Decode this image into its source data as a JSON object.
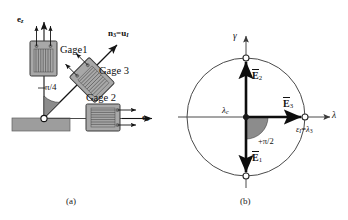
{
  "figure": {
    "panel_a": {
      "caption": "(a)",
      "axis_vertical_label": "e",
      "axis_vertical_sub": "z",
      "axis_horizontal_label": "e",
      "axis_horizontal_sub": "θ",
      "gage1_label": "Gage1",
      "gage2_label": "Gage 2",
      "gage3_label": "Gage 3",
      "normal_label_n": "n",
      "normal_label_n_sub": "3",
      "normal_label_eq": "=",
      "normal_label_u": "u",
      "normal_label_u_sub": "I",
      "angle_label": "π/4",
      "colors": {
        "gage_fill": "#a8a8a8",
        "gage_stroke": "#3a3a3a",
        "plate_fill": "#9d9d9d",
        "wedge_fill": "#8c8c8c",
        "line": "#141414"
      }
    },
    "panel_b": {
      "caption": "(b)",
      "axis_y_label": "γ",
      "axis_x_label": "λ",
      "center_label": "λ",
      "center_label_sub": "c",
      "vec_e1": "E",
      "vec_e1_sub": "1",
      "vec_e2": "E",
      "vec_e2_sub": "2",
      "vec_e3": "E",
      "vec_e3_sub": "3",
      "angle_label": "+π/2",
      "point_label_eps": "ε",
      "point_label_eps_sub": "I",
      "point_label_eq": "=",
      "point_label_lam": "λ",
      "point_label_lam_sub": "3",
      "colors": {
        "circle_stroke": "#4a4a4a",
        "axis": "#4a4a4a",
        "vector": "#0d0d0d",
        "wedge_fill": "#8c8c8c",
        "node_fill": "#ffffff"
      }
    }
  }
}
